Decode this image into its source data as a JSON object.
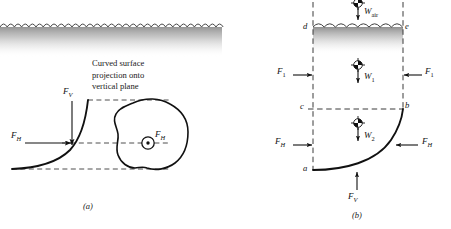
{
  "figure": {
    "type": "engineering-diagram",
    "panels": [
      {
        "id": "a",
        "caption": "(a)",
        "annotation": "Curved surface\nprojection onto\nvertical plane",
        "labels": [
          {
            "name": "f-v",
            "text": "F",
            "sub": "V",
            "role": "vertical-force"
          },
          {
            "name": "f-h",
            "text": "F",
            "sub": "H",
            "role": "horizontal-force"
          },
          {
            "name": "f-h-projection",
            "text": "F",
            "sub": "H",
            "role": "horizontal-force-into-page"
          }
        ],
        "icons": [
          "water-surface-wavy",
          "curved-surface-line",
          "projection-blob",
          "into-page-dot"
        ]
      },
      {
        "id": "b",
        "caption": "(b)",
        "points": [
          "a",
          "b",
          "c",
          "d",
          "e"
        ],
        "labels": [
          {
            "name": "w-air",
            "text": "W",
            "sub": "air",
            "role": "weight-of-air"
          },
          {
            "name": "w-1",
            "text": "W",
            "sub": "1",
            "role": "weight-block-1"
          },
          {
            "name": "w-2",
            "text": "W",
            "sub": "2",
            "role": "weight-block-2"
          },
          {
            "name": "f-1-left",
            "text": "F",
            "sub": "1",
            "role": "pressure-force-left"
          },
          {
            "name": "f-1-right",
            "text": "F",
            "sub": "1",
            "role": "pressure-force-right"
          },
          {
            "name": "f-h-left",
            "text": "F",
            "sub": "H",
            "role": "horizontal-force-left"
          },
          {
            "name": "f-h-right",
            "text": "F",
            "sub": "H",
            "role": "horizontal-force-right"
          },
          {
            "name": "f-v-bottom",
            "text": "F",
            "sub": "V",
            "role": "vertical-force-bottom"
          }
        ],
        "icons": [
          "water-surface-wavy",
          "centroid-marker",
          "curved-surface-line",
          "dashed-control-volume"
        ]
      }
    ],
    "colors": {
      "line": "#1a1a1a",
      "dashed": "#3a3a3a",
      "water_fill": "#9a9a9a",
      "background": "#ffffff"
    }
  }
}
